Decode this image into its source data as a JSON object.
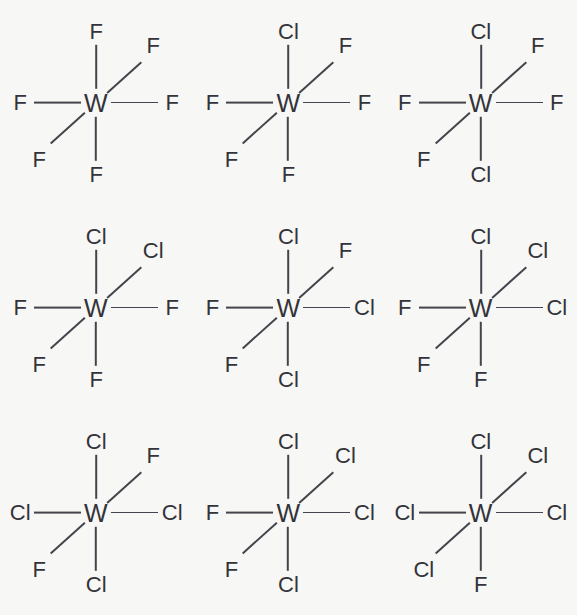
{
  "figure": {
    "center_atom": "W",
    "ligand_f": "F",
    "ligand_cl": "Cl",
    "bond_color": "#44444c",
    "text_color": "#33333a",
    "background_color": "#f7f7f5",
    "grid_rows": 3,
    "grid_cols": 3
  },
  "chart_data": {
    "type": "diagram",
    "title": "",
    "center_atom": "W",
    "positions": [
      "up",
      "upright",
      "left",
      "right",
      "downleft",
      "down"
    ],
    "molecules": [
      {
        "index": 1,
        "formula": "WF6",
        "cl_count": 0,
        "f_count": 6,
        "up": "F",
        "upright": "F",
        "left": "F",
        "right": "F",
        "downleft": "F",
        "down": "F"
      },
      {
        "index": 2,
        "formula": "WF5Cl",
        "cl_count": 1,
        "f_count": 5,
        "up": "Cl",
        "upright": "F",
        "left": "F",
        "right": "F",
        "downleft": "F",
        "down": "F"
      },
      {
        "index": 3,
        "formula": "WF4Cl2",
        "cl_count": 2,
        "f_count": 4,
        "up": "Cl",
        "upright": "F",
        "left": "F",
        "right": "F",
        "downleft": "F",
        "down": "Cl"
      },
      {
        "index": 4,
        "formula": "WF4Cl2",
        "cl_count": 2,
        "f_count": 4,
        "up": "Cl",
        "upright": "Cl",
        "left": "F",
        "right": "F",
        "downleft": "F",
        "down": "F"
      },
      {
        "index": 5,
        "formula": "WF3Cl3",
        "cl_count": 3,
        "f_count": 3,
        "up": "Cl",
        "upright": "F",
        "left": "F",
        "right": "Cl",
        "downleft": "F",
        "down": "Cl"
      },
      {
        "index": 6,
        "formula": "WF3Cl3",
        "cl_count": 3,
        "f_count": 3,
        "up": "Cl",
        "upright": "Cl",
        "left": "F",
        "right": "Cl",
        "downleft": "F",
        "down": "F"
      },
      {
        "index": 7,
        "formula": "WF2Cl4",
        "cl_count": 4,
        "f_count": 2,
        "up": "Cl",
        "upright": "F",
        "left": "Cl",
        "right": "Cl",
        "downleft": "F",
        "down": "Cl"
      },
      {
        "index": 8,
        "formula": "WF2Cl4",
        "cl_count": 4,
        "f_count": 2,
        "up": "Cl",
        "upright": "Cl",
        "left": "F",
        "right": "Cl",
        "downleft": "F",
        "down": "Cl"
      },
      {
        "index": 9,
        "formula": "WFCl5",
        "cl_count": 5,
        "f_count": 1,
        "up": "Cl",
        "upright": "Cl",
        "left": "Cl",
        "right": "Cl",
        "downleft": "Cl",
        "down": "F"
      }
    ]
  }
}
